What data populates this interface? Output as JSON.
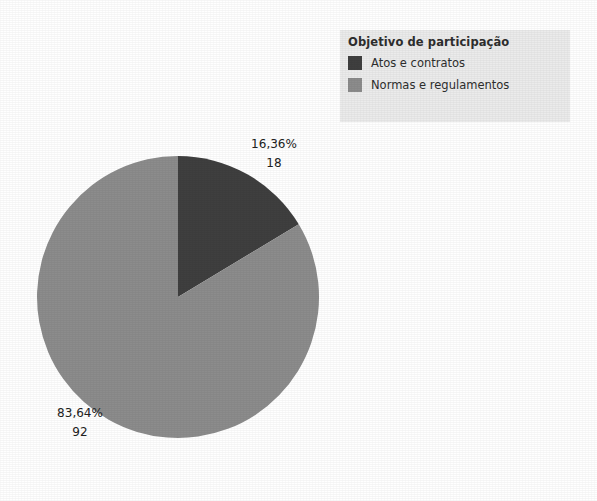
{
  "legend": {
    "title": "Objetivo de participação",
    "entries": [
      {
        "label": "Atos e contratos",
        "color": "#3f3f3f"
      },
      {
        "label": "Normas e regulamentos",
        "color": "#8c8c8c"
      }
    ],
    "background": "#ebebeb"
  },
  "labels": [
    {
      "percent": "16,36%",
      "value": "18"
    },
    {
      "percent": "83,64%",
      "value": "92"
    }
  ],
  "chart_data": {
    "type": "pie",
    "title": "",
    "legend_title": "Objetivo de participação",
    "legend_position": "top-right",
    "categories": [
      "Atos e contratos",
      "Normas e regulamentos"
    ],
    "values": [
      18,
      92
    ],
    "percentages": [
      16.36,
      83.64
    ],
    "percent_labels": [
      "16,36%",
      "83,64%"
    ],
    "value_labels": [
      "18",
      "92"
    ],
    "colors": [
      "#3f3f3f",
      "#8c8c8c"
    ],
    "total": 110,
    "start_angle_deg": 0,
    "direction": "clockwise",
    "grid": false,
    "xlabel": "",
    "ylabel": ""
  }
}
